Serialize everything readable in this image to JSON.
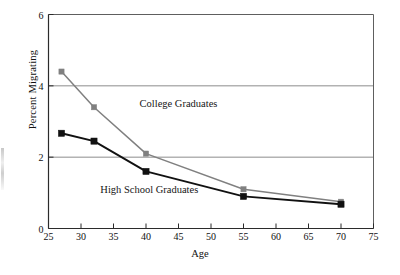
{
  "chart_data": {
    "type": "line",
    "title": "",
    "xlabel": "Age",
    "ylabel": "Percent Migrating",
    "x": [
      27,
      32,
      40,
      55,
      70
    ],
    "xlim": [
      25,
      75
    ],
    "ylim": [
      0,
      6
    ],
    "xticks": [
      25,
      30,
      35,
      40,
      45,
      50,
      55,
      60,
      65,
      70,
      75
    ],
    "xtick_labels": [
      "25",
      "30",
      "35",
      "40",
      "45",
      "50",
      "55",
      "60",
      "65",
      "70",
      "75"
    ],
    "yticks": [
      0,
      2,
      4,
      6
    ],
    "ytick_labels": [
      "0",
      "2",
      "4",
      "6"
    ],
    "gridlines": {
      "horizontal": [
        2,
        4
      ],
      "vertical": [],
      "color": "#8c8c8c"
    },
    "legend_position": "inline-annotation",
    "series": [
      {
        "name": "College Graduates",
        "color": "#808080",
        "marker": "square",
        "values": [
          4.4,
          3.4,
          2.1,
          1.1,
          0.75
        ],
        "label_x": 45,
        "label_y": 3.45
      },
      {
        "name": "High School Graduates",
        "color": "#111111",
        "marker": "square",
        "values": [
          2.67,
          2.45,
          1.6,
          0.9,
          0.68
        ],
        "label_x": 40.5,
        "label_y": 1.04
      }
    ],
    "annotations": [
      {
        "text": "College Graduates",
        "x": 45,
        "y": 3.45
      },
      {
        "text": "High School Graduates",
        "x": 40.5,
        "y": 1.04
      }
    ]
  },
  "axes": {
    "frame_color": "#5e5e5e",
    "axis_color": "#2b2b2b"
  }
}
